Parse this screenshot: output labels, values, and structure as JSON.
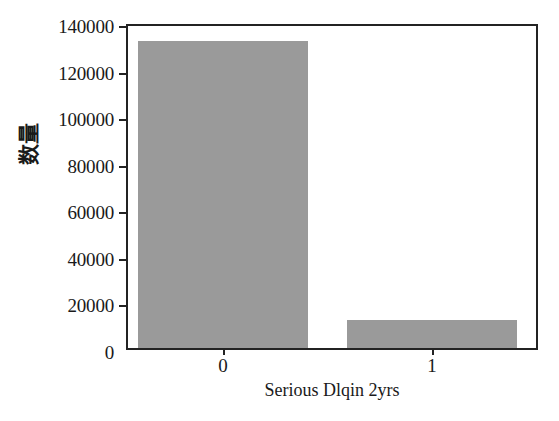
{
  "chart_data": {
    "type": "bar",
    "title": "",
    "subtitle": "",
    "xlabel": "Serious Dlqin 2yrs",
    "ylabel": "数量",
    "categories": [
      "0",
      "1"
    ],
    "values": [
      140000,
      12700
    ],
    "series": [
      {
        "name": "数量",
        "values": [
          140000,
          12700
        ]
      }
    ],
    "ylim": [
      0,
      147000
    ],
    "xlim": [
      0,
      2
    ],
    "yticks": [
      0,
      20000,
      40000,
      60000,
      80000,
      100000,
      120000,
      140000
    ],
    "ytick_labels": [
      "0",
      "20000",
      "40000",
      "60000",
      "80000",
      "100000",
      "120000",
      "140000"
    ],
    "xtick_labels": [
      "0",
      "1"
    ],
    "grid": false,
    "legend": false,
    "legend_position": "none",
    "bar_color": "#9a9a9a",
    "frame_color": "#232323",
    "background_color": "#ffffff",
    "annotations": []
  },
  "axes": {
    "y": {
      "label": "数量",
      "ticks": [
        {
          "value": 140000,
          "label": "140000"
        },
        {
          "value": 120000,
          "label": "120000"
        },
        {
          "value": 100000,
          "label": "100000"
        },
        {
          "value": 80000,
          "label": "80000"
        },
        {
          "value": 60000,
          "label": "60000"
        },
        {
          "value": 40000,
          "label": "40000"
        },
        {
          "value": 20000,
          "label": "20000"
        },
        {
          "value": 0,
          "label": "0"
        }
      ]
    },
    "x": {
      "label": "Serious Dlqin 2yrs",
      "ticks": [
        {
          "value": 0,
          "label": "0"
        },
        {
          "value": 1,
          "label": "1"
        }
      ]
    }
  }
}
